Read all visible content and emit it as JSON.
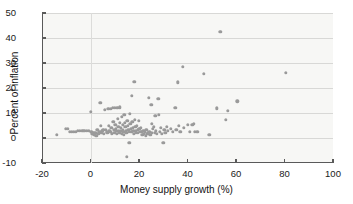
{
  "chart_data": {
    "type": "scatter",
    "title": "",
    "xlabel": "Money supply growth (%)",
    "ylabel": "Percent of inflation",
    "xlim": [
      -20,
      100
    ],
    "ylim": [
      -10,
      50
    ],
    "xticks": [
      -20,
      0,
      20,
      40,
      60,
      80,
      100
    ],
    "yticks": [
      -10,
      0,
      10,
      20,
      30,
      40,
      50
    ],
    "xtick_labels": [
      "-20",
      "0",
      "20",
      "40",
      "60",
      "80",
      "100"
    ],
    "ytick_labels": [
      "-10",
      "0",
      "10",
      "20",
      "30",
      "40",
      "50"
    ],
    "grid": "horizontal-and-zero-vertical",
    "legend": null,
    "marker_color": "#9a9a9a",
    "plot_background": "#f7f7f5",
    "points": [
      [
        -14.0,
        1.2
      ],
      [
        -10.2,
        3.6
      ],
      [
        -9.4,
        3.6
      ],
      [
        -8.6,
        2.4
      ],
      [
        -7.6,
        2.6
      ],
      [
        -6.8,
        2.6
      ],
      [
        -6.0,
        2.6
      ],
      [
        -5.2,
        2.8
      ],
      [
        -4.4,
        2.8
      ],
      [
        -3.4,
        2.8
      ],
      [
        -2.6,
        2.9
      ],
      [
        -1.6,
        3.0
      ],
      [
        -0.6,
        3.0
      ],
      [
        0.2,
        10.6
      ],
      [
        0.4,
        2.4
      ],
      [
        0.8,
        1.8
      ],
      [
        1.2,
        2.0
      ],
      [
        1.6,
        1.4
      ],
      [
        2.0,
        2.2
      ],
      [
        2.4,
        1.0
      ],
      [
        2.8,
        3.4
      ],
      [
        3.2,
        1.6
      ],
      [
        3.6,
        2.6
      ],
      [
        4.0,
        14.1
      ],
      [
        4.2,
        4.8
      ],
      [
        4.4,
        2.0
      ],
      [
        4.8,
        2.8
      ],
      [
        5.2,
        3.2
      ],
      [
        5.6,
        1.8
      ],
      [
        6.0,
        11.2
      ],
      [
        6.2,
        3.4
      ],
      [
        6.6,
        2.4
      ],
      [
        7.0,
        2.0
      ],
      [
        7.4,
        11.6
      ],
      [
        7.6,
        5.0
      ],
      [
        7.8,
        3.0
      ],
      [
        8.2,
        2.6
      ],
      [
        8.4,
        11.8
      ],
      [
        8.6,
        4.2
      ],
      [
        8.8,
        1.8
      ],
      [
        9.2,
        12.0
      ],
      [
        9.4,
        6.4
      ],
      [
        9.6,
        3.4
      ],
      [
        9.8,
        2.2
      ],
      [
        10.0,
        12.2
      ],
      [
        10.2,
        5.4
      ],
      [
        10.4,
        3.8
      ],
      [
        10.6,
        2.8
      ],
      [
        10.8,
        1.6
      ],
      [
        11.0,
        12.2
      ],
      [
        11.2,
        7.8
      ],
      [
        11.4,
        4.6
      ],
      [
        11.6,
        3.0
      ],
      [
        11.8,
        2.2
      ],
      [
        12.0,
        12.3
      ],
      [
        12.2,
        6.0
      ],
      [
        12.4,
        4.0
      ],
      [
        12.6,
        2.8
      ],
      [
        12.8,
        1.8
      ],
      [
        13.0,
        8.6
      ],
      [
        13.2,
        5.2
      ],
      [
        13.4,
        3.4
      ],
      [
        13.6,
        2.4
      ],
      [
        13.8,
        1.2
      ],
      [
        14.0,
        9.4
      ],
      [
        14.2,
        6.2
      ],
      [
        14.4,
        4.4
      ],
      [
        14.6,
        3.0
      ],
      [
        14.8,
        2.0
      ],
      [
        15.0,
        -7.4
      ],
      [
        15.2,
        7.0
      ],
      [
        15.4,
        4.8
      ],
      [
        15.6,
        3.4
      ],
      [
        15.8,
        2.4
      ],
      [
        16.0,
        -2.0
      ],
      [
        16.2,
        9.6
      ],
      [
        16.4,
        5.6
      ],
      [
        16.6,
        3.8
      ],
      [
        16.8,
        2.6
      ],
      [
        17.0,
        16.9
      ],
      [
        17.2,
        6.6
      ],
      [
        17.4,
        4.2
      ],
      [
        17.6,
        2.8
      ],
      [
        17.8,
        1.8
      ],
      [
        18.0,
        22.4
      ],
      [
        18.2,
        7.2
      ],
      [
        18.4,
        4.6
      ],
      [
        18.6,
        3.0
      ],
      [
        18.8,
        2.0
      ],
      [
        19.2,
        5.0
      ],
      [
        19.4,
        3.4
      ],
      [
        19.6,
        2.2
      ],
      [
        20.0,
        6.8
      ],
      [
        20.2,
        3.8
      ],
      [
        20.4,
        2.4
      ],
      [
        20.8,
        4.2
      ],
      [
        21.0,
        2.6
      ],
      [
        21.4,
        1.4
      ],
      [
        21.8,
        3.0
      ],
      [
        22.0,
        1.8
      ],
      [
        22.4,
        2.4
      ],
      [
        22.8,
        0.8
      ],
      [
        23.0,
        3.2
      ],
      [
        23.4,
        1.6
      ],
      [
        23.8,
        2.0
      ],
      [
        24.0,
        16.2
      ],
      [
        24.2,
        2.6
      ],
      [
        24.6,
        1.2
      ],
      [
        25.0,
        13.4
      ],
      [
        25.2,
        5.8
      ],
      [
        25.4,
        2.2
      ],
      [
        25.8,
        3.6
      ],
      [
        26.0,
        4.4
      ],
      [
        26.4,
        2.0
      ],
      [
        26.8,
        8.8
      ],
      [
        27.0,
        3.0
      ],
      [
        27.4,
        1.6
      ],
      [
        28.0,
        15.6
      ],
      [
        28.2,
        9.4
      ],
      [
        28.6,
        2.4
      ],
      [
        29.0,
        4.0
      ],
      [
        29.4,
        1.8
      ],
      [
        30.0,
        -1.8
      ],
      [
        30.4,
        3.4
      ],
      [
        30.8,
        2.2
      ],
      [
        31.4,
        4.6
      ],
      [
        32.0,
        3.0
      ],
      [
        33.0,
        3.8
      ],
      [
        34.0,
        2.6
      ],
      [
        35.0,
        12.1
      ],
      [
        35.4,
        3.4
      ],
      [
        36.0,
        22.3
      ],
      [
        36.4,
        5.0
      ],
      [
        37.0,
        2.4
      ],
      [
        38.0,
        28.6
      ],
      [
        38.6,
        4.0
      ],
      [
        40.0,
        5.4
      ],
      [
        41.0,
        2.6
      ],
      [
        42.0,
        5.2
      ],
      [
        42.6,
        5.6
      ],
      [
        43.0,
        2.6
      ],
      [
        44.0,
        2.6
      ],
      [
        46.8,
        25.8
      ],
      [
        49.0,
        1.2
      ],
      [
        52.0,
        11.9
      ],
      [
        53.6,
        42.6
      ],
      [
        55.8,
        7.4
      ],
      [
        56.6,
        10.9
      ],
      [
        60.6,
        14.7
      ],
      [
        80.6,
        26.1
      ]
    ]
  }
}
